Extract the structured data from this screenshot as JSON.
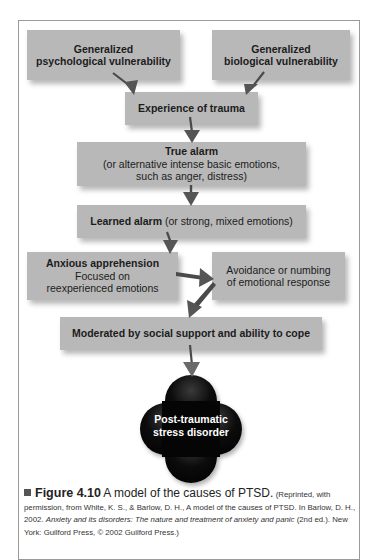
{
  "diagram": {
    "box_color": "#b8b8b8",
    "arrow_color": "#5a5a5a",
    "nodes": [
      {
        "id": "psych_vuln",
        "lines": [
          "Generalized",
          "psychological vulnerability"
        ],
        "bold": true
      },
      {
        "id": "bio_vuln",
        "lines": [
          "Generalized",
          "biological vulnerability"
        ],
        "bold": true
      },
      {
        "id": "trauma",
        "lines": [
          "Experience of trauma"
        ],
        "bold": true
      },
      {
        "id": "true_alarm",
        "title": "True alarm",
        "lines": [
          "(or alternative intense basic emotions,",
          "such as anger, distress)"
        ]
      },
      {
        "id": "learned_alarm",
        "title": "Learned alarm",
        "suffix": " (or strong, mixed emotions)"
      },
      {
        "id": "anxious_apprehension",
        "title": "Anxious apprehension",
        "lines": [
          "Focused on",
          "reexperienced emotions"
        ]
      },
      {
        "id": "avoidance",
        "lines": [
          "Avoidance or numbing",
          "of emotional response"
        ]
      },
      {
        "id": "moderated",
        "lines": [
          "Moderated by social support and ability to cope"
        ],
        "bold": true
      },
      {
        "id": "ptsd",
        "lines": [
          "Post-traumatic",
          "stress disorder"
        ],
        "shape": "black four-lobed cluster"
      }
    ],
    "edges": [
      [
        "psych_vuln",
        "trauma"
      ],
      [
        "bio_vuln",
        "trauma"
      ],
      [
        "trauma",
        "true_alarm"
      ],
      [
        "true_alarm",
        "learned_alarm"
      ],
      [
        "learned_alarm",
        "anxious_apprehension"
      ],
      [
        "anxious_apprehension",
        "avoidance"
      ],
      [
        "avoidance",
        "moderated"
      ],
      [
        "moderated",
        "ptsd"
      ]
    ]
  },
  "caption": {
    "figure_label": "Figure 4.10",
    "title": "A model of the causes of PTSD.",
    "credit_1": "(Reprinted, with permission, from White, K. S., & Barlow, D. H., A model of the causes of PTSD. In Barlow, D. H., 2002. ",
    "book_title": "Anxiety and its disorders: The nature and treatment of anxiety and panic",
    "credit_2": " (2nd ed.). New York: Guilford Press, © 2002 Guilford Press.)"
  }
}
